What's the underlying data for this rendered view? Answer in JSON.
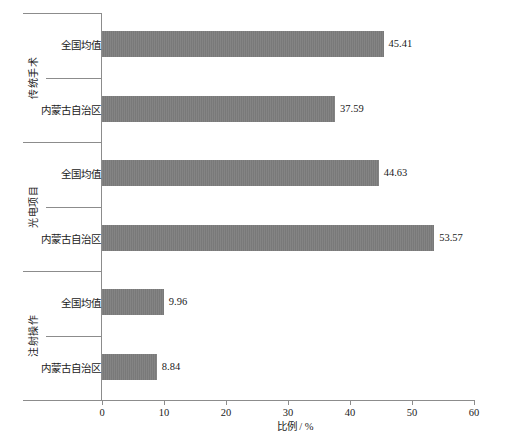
{
  "chart_data": {
    "type": "bar",
    "orientation": "horizontal",
    "title": "",
    "xlabel": "比例 / %",
    "ylabel": "",
    "xlim": [
      0,
      60
    ],
    "xticks": [
      "0",
      "10",
      "20",
      "30",
      "40",
      "50",
      "60"
    ],
    "xtick_values": [
      0,
      10,
      20,
      30,
      40,
      50,
      60
    ],
    "grid": false,
    "legend": false,
    "bar_color": "#7d7d7d",
    "axis_color": "#8c8c8c",
    "groups": [
      {
        "label": "传统手术",
        "bars": [
          {
            "category": "全国均值",
            "value": 45.41,
            "value_label": "45.41"
          },
          {
            "category": "内蒙古自治区",
            "value": 37.59,
            "value_label": "37.59"
          }
        ]
      },
      {
        "label": "光电项目",
        "bars": [
          {
            "category": "全国均值",
            "value": 44.63,
            "value_label": "44.63"
          },
          {
            "category": "内蒙古自治区",
            "value": 53.57,
            "value_label": "53.57"
          }
        ]
      },
      {
        "label": "注射操作",
        "bars": [
          {
            "category": "全国均值",
            "value": 9.96,
            "value_label": "9.96"
          },
          {
            "category": "内蒙古自治区",
            "value": 8.84,
            "value_label": "8.84"
          }
        ]
      }
    ],
    "categories": [
      "传统手术 / 全国均值",
      "传统手术 / 内蒙古自治区",
      "光电项目 / 全国均值",
      "光电项目 / 内蒙古自治区",
      "注射操作 / 全国均值",
      "注射操作 / 内蒙古自治区"
    ],
    "values": [
      45.41,
      37.59,
      44.63,
      53.57,
      9.96,
      8.84
    ]
  },
  "axis": {
    "x_title": "比例 / %",
    "ticks": [
      "0",
      "10",
      "20",
      "30",
      "40",
      "50",
      "60"
    ]
  },
  "groups": {
    "g0": {
      "label": "传统手术"
    },
    "g1": {
      "label": "光电项目"
    },
    "g2": {
      "label": "注射操作"
    }
  },
  "bars": {
    "b0": {
      "category": "全国均值",
      "value_label": "45.41"
    },
    "b1": {
      "category": "内蒙古自治区",
      "value_label": "37.59"
    },
    "b2": {
      "category": "全国均值",
      "value_label": "44.63"
    },
    "b3": {
      "category": "内蒙古自治区",
      "value_label": "53.57"
    },
    "b4": {
      "category": "全国均值",
      "value_label": "9.96"
    },
    "b5": {
      "category": "内蒙古自治区",
      "value_label": "8.84"
    }
  }
}
